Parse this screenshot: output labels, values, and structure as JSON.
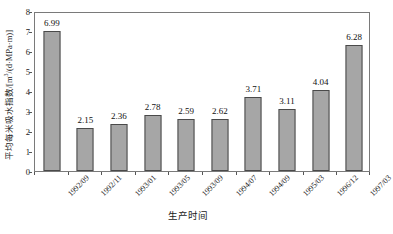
{
  "chart_data": {
    "type": "bar",
    "title": "",
    "xlabel": "生产时间",
    "ylabel": "平均每米吸水指数/[m³/(d·MPa·m)]",
    "ylabel_parts": {
      "prefix": "平均每米吸水指数/[m",
      "exponent": "3",
      "suffix": "/(d·MPa·m)]"
    },
    "categories": [
      "1992/09",
      "1992/11",
      "1993/01",
      "1993/05",
      "1993/09",
      "1994/07",
      "1994/09",
      "1995/03",
      "1996/12",
      "1997/03"
    ],
    "values": [
      6.99,
      2.15,
      2.36,
      2.78,
      2.59,
      2.62,
      3.71,
      3.11,
      4.04,
      6.28
    ],
    "value_labels": [
      "6.99",
      "2.15",
      "2.36",
      "2.78",
      "2.59",
      "2.62",
      "3.71",
      "3.11",
      "4.04",
      "6.28"
    ],
    "ylim": [
      0,
      8
    ],
    "yticks": [
      0,
      1,
      2,
      3,
      4,
      5,
      6,
      7,
      8
    ],
    "ytick_labels": [
      "0",
      "1",
      "2",
      "3",
      "4",
      "5",
      "6",
      "7",
      "8"
    ],
    "grid": false,
    "legend": null,
    "legend_position": "none",
    "bar_fill_color": "#a6a6a6",
    "bar_edge_color": "#4a4a4a",
    "frame_color": "#7a7a7a",
    "background_color": "#ffffff",
    "text_color": "#111111"
  }
}
